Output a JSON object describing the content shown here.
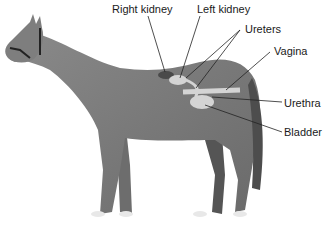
{
  "diagram": {
    "labels": {
      "right_kidney": "Right kidney",
      "left_kidney": "Left kidney",
      "ureters": "Ureters",
      "vagina": "Vagina",
      "urethra": "Urethra",
      "bladder": "Bladder"
    },
    "colors": {
      "body": "#7a7a7a",
      "body_dark": "#5a5a5a",
      "organ": "#d4d4d4",
      "line": "#222222"
    }
  }
}
